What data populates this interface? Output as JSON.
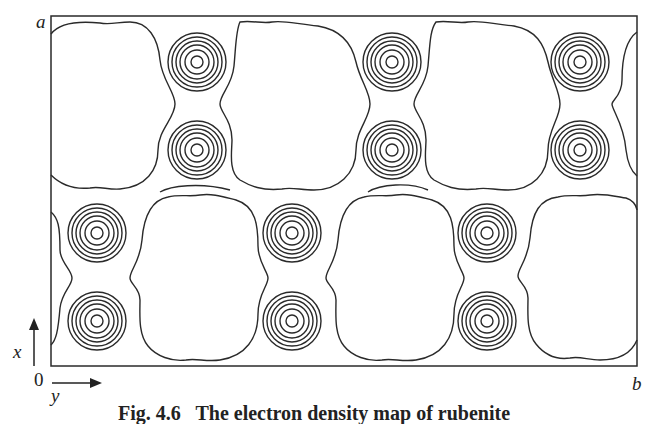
{
  "figure": {
    "caption": "Fig. 4.6   The electron density map of rubenite",
    "corner_labels": {
      "top_left": "a",
      "bottom_left": "0",
      "bottom_right": "b"
    },
    "axes": {
      "vertical": {
        "label": "x",
        "direction": "up"
      },
      "horizontal": {
        "label": "y",
        "direction": "right"
      }
    },
    "frame": {
      "left": 51,
      "top": 16,
      "right": 637,
      "bottom": 366
    },
    "line_color": "#2a2a2a",
    "atom_pairs": [
      {
        "row": "top",
        "cx": 197,
        "cy": [
          62,
          150
        ]
      },
      {
        "row": "top",
        "cx": 392,
        "cy": [
          62,
          150
        ]
      },
      {
        "row": "top",
        "cx": 580,
        "cy": [
          62,
          150
        ]
      },
      {
        "row": "bottom",
        "cx": 97,
        "cy": [
          233,
          321
        ]
      },
      {
        "row": "bottom",
        "cx": 292,
        "cy": [
          233,
          321
        ]
      },
      {
        "row": "bottom",
        "cx": 487,
        "cy": [
          233,
          321
        ]
      }
    ],
    "ring_radii": [
      6,
      12,
      17,
      21,
      25,
      29
    ]
  }
}
